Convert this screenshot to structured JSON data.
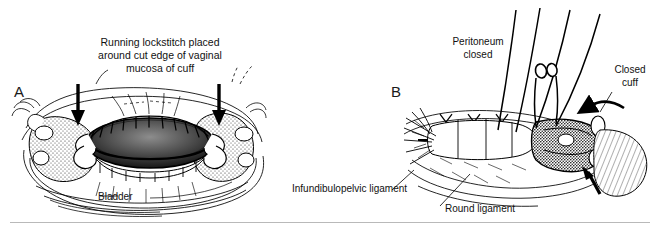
{
  "figure": {
    "style": "black-and-white surgical line illustration",
    "background_color": "#ffffff",
    "ink_color": "#000000",
    "panels": [
      {
        "letter": "A",
        "subject": "vaginal cuff with running lockstitch around cut edge",
        "caption": "Running lockstitch placed\naround cut edge of vaginal\nmucosa of cuff",
        "labels": [
          {
            "name": "bladder",
            "text": "Bladder"
          }
        ],
        "arrows": [
          {
            "name": "left-down-arrow",
            "direction": "down"
          },
          {
            "name": "right-down-arrow",
            "direction": "down"
          }
        ]
      },
      {
        "letter": "B",
        "subject": "closed vaginal cuff with peritoneum closed and ligaments identified",
        "labels": [
          {
            "name": "peritoneum-closed",
            "text": "Peritoneum\nclosed"
          },
          {
            "name": "closed-cuff",
            "text": "Closed\ncuff"
          },
          {
            "name": "infundibulopelvic-ligament",
            "text": "Infundibulopelvic ligament"
          },
          {
            "name": "round-ligament",
            "text": "Round ligament"
          }
        ],
        "arrows": [
          {
            "name": "curved-left-arrow",
            "direction": "left"
          },
          {
            "name": "up-arrow",
            "direction": "up"
          }
        ]
      }
    ],
    "footer_rule": {
      "name": "bottom-divider",
      "color": "#b9b9b9"
    }
  }
}
